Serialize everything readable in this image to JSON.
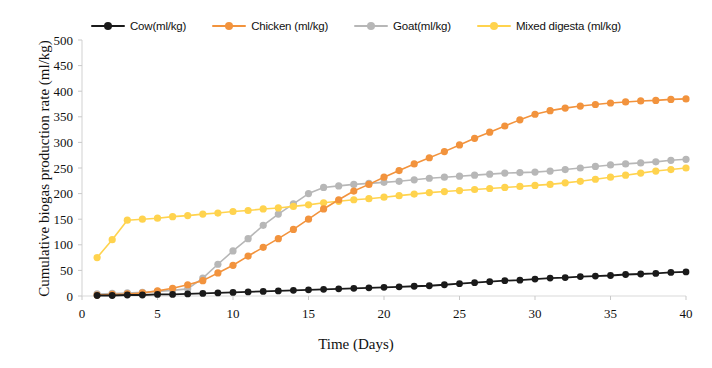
{
  "chart_data": {
    "type": "line",
    "title": "",
    "xlabel": "Time (Days)",
    "ylabel": "Cumulative biogas production rate  (ml/kg)",
    "xlim": [
      0,
      40
    ],
    "ylim": [
      0,
      500
    ],
    "xticks": [
      0,
      5,
      10,
      15,
      20,
      25,
      30,
      35,
      40
    ],
    "yticks": [
      0,
      50,
      100,
      150,
      200,
      250,
      300,
      350,
      400,
      450,
      500
    ],
    "grid": false,
    "legend_position": "top-center",
    "x": [
      1,
      2,
      3,
      4,
      5,
      6,
      7,
      8,
      9,
      10,
      11,
      12,
      13,
      14,
      15,
      16,
      17,
      18,
      19,
      20,
      21,
      22,
      23,
      24,
      25,
      26,
      27,
      28,
      29,
      30,
      31,
      32,
      33,
      34,
      35,
      36,
      37,
      38,
      39,
      40
    ],
    "series": [
      {
        "name": "Cow(ml/kg)",
        "color": "#1a1a1a",
        "marker": "circle",
        "values": [
          1,
          1,
          2,
          2,
          3,
          3,
          4,
          5,
          6,
          7,
          8,
          9,
          10,
          11,
          12,
          13,
          14,
          15,
          16,
          17,
          18,
          19,
          20,
          22,
          24,
          26,
          28,
          30,
          31,
          33,
          35,
          36,
          38,
          39,
          40,
          42,
          43,
          44,
          46,
          47
        ]
      },
      {
        "name": "Chicken (ml/kg)",
        "color": "#F2933D",
        "marker": "circle",
        "values": [
          2,
          3,
          4,
          6,
          10,
          15,
          22,
          30,
          45,
          60,
          78,
          95,
          112,
          130,
          150,
          170,
          188,
          205,
          218,
          232,
          245,
          258,
          270,
          282,
          295,
          308,
          320,
          332,
          344,
          355,
          362,
          367,
          371,
          374,
          377,
          379,
          381,
          382,
          384,
          385
        ]
      },
      {
        "name": "Goat(ml/kg)",
        "color": "#B7B7B7",
        "marker": "circle",
        "values": [
          4,
          5,
          6,
          7,
          9,
          11,
          14,
          35,
          62,
          88,
          112,
          138,
          160,
          180,
          200,
          212,
          215,
          218,
          220,
          222,
          224,
          227,
          230,
          232,
          234,
          236,
          238,
          240,
          241,
          242,
          244,
          247,
          250,
          253,
          256,
          258,
          260,
          262,
          265,
          267
        ]
      },
      {
        "name": "Mixed digesta (ml/kg)",
        "color": "#FFD34E",
        "marker": "circle",
        "values": [
          75,
          110,
          148,
          150,
          152,
          155,
          157,
          160,
          162,
          165,
          167,
          170,
          172,
          175,
          178,
          182,
          185,
          188,
          190,
          193,
          196,
          199,
          202,
          204,
          206,
          208,
          210,
          212,
          214,
          216,
          218,
          221,
          224,
          228,
          232,
          236,
          240,
          244,
          247,
          250
        ]
      }
    ]
  },
  "legend": {
    "items": [
      {
        "label": "Cow(ml/kg)",
        "color": "#1a1a1a"
      },
      {
        "label": "Chicken (ml/kg)",
        "color": "#F2933D"
      },
      {
        "label": "Goat(ml/kg)",
        "color": "#B7B7B7"
      },
      {
        "label": "Mixed digesta (ml/kg)",
        "color": "#FFD34E"
      }
    ]
  }
}
